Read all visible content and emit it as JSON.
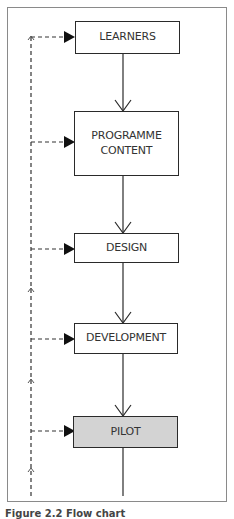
{
  "diagram": {
    "type": "flowchart",
    "nodes": [
      {
        "id": "learners",
        "label": "LEARNERS"
      },
      {
        "id": "programme_content",
        "label": "PROGRAMME CONTENT",
        "line1": "PROGRAMME",
        "line2": "CONTENT"
      },
      {
        "id": "design",
        "label": "DESIGN"
      },
      {
        "id": "development",
        "label": "DEVELOPMENT"
      },
      {
        "id": "pilot",
        "label": "PILOT",
        "highlighted": true
      }
    ],
    "edges": [
      {
        "from": "learners",
        "to": "programme_content",
        "style": "solid"
      },
      {
        "from": "programme_content",
        "to": "design",
        "style": "solid"
      },
      {
        "from": "design",
        "to": "development",
        "style": "solid"
      },
      {
        "from": "development",
        "to": "pilot",
        "style": "solid"
      },
      {
        "from": "pilot",
        "to": "(continues below)",
        "style": "solid"
      }
    ],
    "feedback_loop": {
      "style": "dashed",
      "direction": "upward",
      "targets": [
        "learners",
        "programme_content",
        "design",
        "development",
        "pilot"
      ]
    },
    "colors": {
      "border": "#2a2a2a",
      "highlight_fill": "#d3d3d3",
      "frame": "#8a8a8a"
    }
  },
  "caption": {
    "text": "Figure 2.2 Flow chart"
  }
}
